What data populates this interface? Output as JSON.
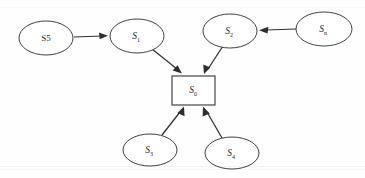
{
  "diagram": {
    "background_color": "#fefefe",
    "stroke_color": "#2e2e2e",
    "node_fill": "#ffffff",
    "center": {
      "id": "S0",
      "shape": "rectangle",
      "label_base": "S",
      "label_sub": "0",
      "x": 193,
      "y": 90,
      "width": 43,
      "height": 29
    },
    "nodes": [
      {
        "id": "S5",
        "shape": "ellipse",
        "label_base": "S5",
        "label_sub": "",
        "subscripted": false,
        "cx": 46,
        "cy": 38,
        "rx": 27,
        "ry": 17
      },
      {
        "id": "S1",
        "shape": "ellipse",
        "label_base": "S",
        "label_sub": "1",
        "subscripted": true,
        "cx": 137,
        "cy": 36,
        "rx": 27,
        "ry": 17
      },
      {
        "id": "S2",
        "shape": "ellipse",
        "label_base": "S",
        "label_sub": "2",
        "subscripted": true,
        "cx": 230,
        "cy": 31,
        "rx": 27,
        "ry": 17
      },
      {
        "id": "Sn",
        "shape": "ellipse",
        "label_base": "S",
        "label_sub": "n",
        "subscripted": true,
        "cx": 324,
        "cy": 29,
        "rx": 28,
        "ry": 17
      },
      {
        "id": "S3",
        "shape": "ellipse",
        "label_base": "S",
        "label_sub": "3",
        "subscripted": true,
        "cx": 150,
        "cy": 150,
        "rx": 27,
        "ry": 16
      },
      {
        "id": "S4",
        "shape": "ellipse",
        "label_base": "S",
        "label_sub": "4",
        "subscripted": true,
        "cx": 232,
        "cy": 153,
        "rx": 27,
        "ry": 16
      }
    ],
    "edges": [
      {
        "id": "edge-s5-s1",
        "from": "S5",
        "to": "S1",
        "x1": 74,
        "y1": 37,
        "x2": 107,
        "y2": 36,
        "direction": "right"
      },
      {
        "id": "edge-sn-s2",
        "from": "Sn",
        "to": "S2",
        "x1": 295,
        "y1": 29,
        "x2": 261,
        "y2": 30,
        "direction": "left"
      },
      {
        "id": "edge-s1-s0",
        "from": "S1",
        "to": "S0",
        "x1": 153,
        "y1": 50,
        "x2": 180,
        "y2": 73,
        "direction": "down-right"
      },
      {
        "id": "edge-s2-s0",
        "from": "S2",
        "to": "S0",
        "x1": 222,
        "y1": 47,
        "x2": 205,
        "y2": 73,
        "direction": "down-left"
      },
      {
        "id": "edge-s3-s0",
        "from": "S3",
        "to": "S0",
        "x1": 163,
        "y1": 136,
        "x2": 182,
        "y2": 108,
        "direction": "up-right"
      },
      {
        "id": "edge-s4-s0",
        "from": "S4",
        "to": "S0",
        "x1": 223,
        "y1": 138,
        "x2": 206,
        "y2": 108,
        "direction": "up-left"
      }
    ]
  }
}
